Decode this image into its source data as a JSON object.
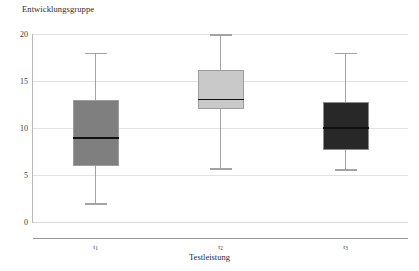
{
  "chart_data": {
    "type": "box",
    "title": "Entwicklungsgruppe",
    "xlabel": "Testleistung",
    "ylabel": "",
    "categories": [
      "t1",
      "t2",
      "t3"
    ],
    "category_labels": [
      {
        "base": "t",
        "sub": "1"
      },
      {
        "base": "t",
        "sub": "2"
      },
      {
        "base": "t",
        "sub": "3"
      }
    ],
    "ylim": [
      0,
      20
    ],
    "yticks": [
      0,
      5,
      10,
      15,
      20
    ],
    "ytick_labels": [
      "0",
      "5",
      "10",
      "15",
      "20"
    ],
    "grid": true,
    "legend": "none",
    "boxes": [
      {
        "category": "t1",
        "whisker_low": 2.0,
        "q1": 6.0,
        "median": 9.0,
        "q3": 13.0,
        "whisker_high": 18.0,
        "fill": "#7f7f7f",
        "edge": "#9d9d9d"
      },
      {
        "category": "t2",
        "whisker_low": 5.7,
        "q1": 12.0,
        "median": 13.1,
        "q3": 16.2,
        "whisker_high": 20.0,
        "fill": "#c9c9c9",
        "edge": "#9d9d9d"
      },
      {
        "category": "t3",
        "whisker_low": 5.6,
        "q1": 7.7,
        "median": 10.1,
        "q3": 12.8,
        "whisker_high": 18.0,
        "fill": "#282828",
        "edge": "#8d8d8d"
      }
    ],
    "colors": {
      "gridline": "#e2e2e2",
      "axis": "#9a9a9a",
      "median": "#111111",
      "whisker": "#a3a3a3",
      "text": "#2b2b2b",
      "background": "#ffffff"
    }
  }
}
